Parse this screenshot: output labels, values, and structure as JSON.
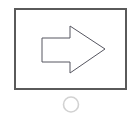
{
  "canvas": {
    "width": 139,
    "height": 116,
    "background_color": "#ffffff"
  },
  "shapes": {
    "frame": {
      "label": "frame-rectangle",
      "x": 14,
      "y": 8,
      "width": 113,
      "height": 82,
      "stroke_color": "#5a5a5a",
      "stroke_width": 2,
      "fill_color": "#ffffff"
    },
    "arrow": {
      "label": "right-arrow-outline",
      "direction": "right",
      "points": "42,38 70,38 70,26 105,49 70,73 70,62 42,62",
      "tail_left_x": 42,
      "tail_top_y": 38,
      "tail_bottom_y": 62,
      "head_base_x": 70,
      "head_top_y": 26,
      "head_bottom_y": 73,
      "tip_x": 105,
      "tip_y": 49,
      "stroke_color": "#565660",
      "stroke_width": 1,
      "fill_color": "#ffffff"
    },
    "circle": {
      "label": "handle-circle",
      "cx": 71,
      "cy": 104.5,
      "r": 7.5,
      "stroke_color": "#d2d2d2",
      "stroke_width": 1.6,
      "fill_color": "#ffffff"
    }
  }
}
